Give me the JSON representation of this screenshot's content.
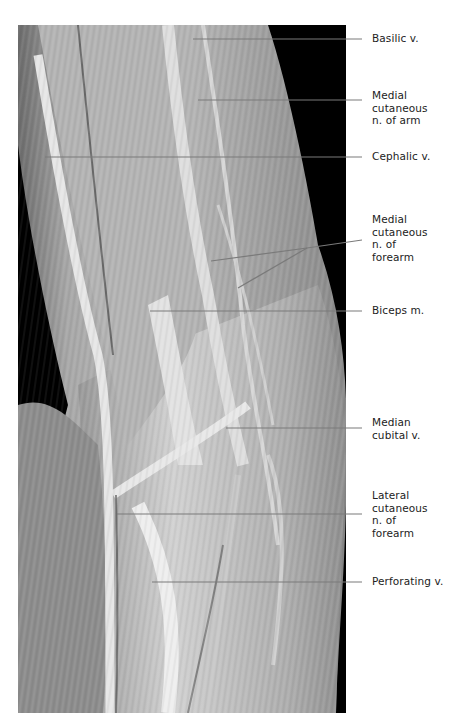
{
  "figure": {
    "labels": [
      {
        "id": "basilic-v",
        "text": "Basilic v.",
        "top": 32,
        "line_y": 39,
        "targets": [
          [
            193,
            39
          ]
        ]
      },
      {
        "id": "medial-cutaneous-n-arm",
        "text": "Medial\ncutaneous\nn. of arm",
        "top": 83,
        "line_y": 100,
        "targets": [
          [
            198,
            100
          ]
        ]
      },
      {
        "id": "cephalic-v",
        "text": "Cephalic v.",
        "top": 150,
        "line_y": 157,
        "targets": [
          [
            45,
            157
          ]
        ]
      },
      {
        "id": "medial-cutaneous-n-forearm",
        "text": "Medial\ncutaneous\nn. of\nforearm",
        "top": 215,
        "line_y": 241,
        "targets": [
          [
            211,
            261
          ],
          [
            238,
            288
          ]
        ]
      },
      {
        "id": "biceps-m",
        "text": "Biceps m.",
        "top": 304,
        "line_y": 311,
        "targets": [
          [
            150,
            311
          ]
        ]
      },
      {
        "id": "median-cubital-v",
        "text": "Median\ncubital v.",
        "top": 418,
        "line_y": 428,
        "targets": [
          [
            226,
            428
          ]
        ]
      },
      {
        "id": "lateral-cutaneous-n-forearm",
        "text": "Lateral\ncutaneous\nn. of\nforearm",
        "top": 488,
        "line_y": 514,
        "targets": [
          [
            117,
            514
          ]
        ]
      },
      {
        "id": "perforating-v",
        "text": "Perforating v.",
        "top": 575,
        "line_y": 582,
        "targets": [
          [
            152,
            582
          ]
        ]
      }
    ]
  }
}
